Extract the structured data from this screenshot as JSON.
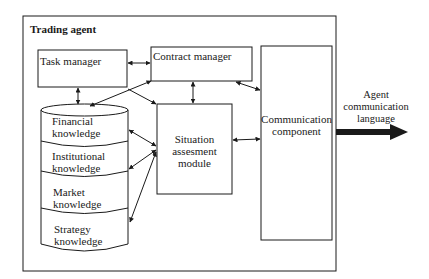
{
  "diagram": {
    "container": {
      "title": "Trading agent"
    },
    "boxes": {
      "task_manager": "Task manager",
      "contract_manager": "Contract manager",
      "situation_module": "Situation\nassesment\nmodule",
      "communication_component": "Communication\ncomponent"
    },
    "knowledge_base": {
      "layers": [
        "Financial\nknowledge",
        "Institutional\nknowledge",
        "Market\nknowledge",
        "Strategy\nknowledge"
      ]
    },
    "output": {
      "label": "Agent\ncommunication\nlanguage"
    },
    "colors": {
      "line": "#1a1a1a",
      "background": "#ffffff"
    }
  }
}
